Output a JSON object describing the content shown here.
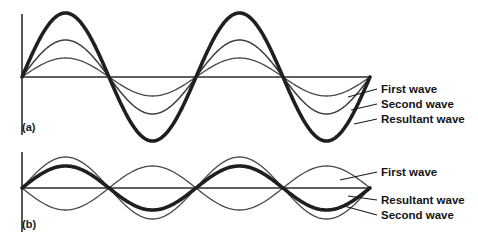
{
  "figure": {
    "background_color": "#ffffff",
    "width": 478,
    "height": 248
  },
  "panels": [
    {
      "tag": "(a)",
      "tag_x": 22,
      "tag_y": 131,
      "baseline_y": 77,
      "axis_x": 22,
      "axis_top": 14,
      "axis_bottom": 135,
      "x_start": 22,
      "x_end": 370,
      "cycles": 2,
      "labels": [
        {
          "text": "First wave",
          "x": 381,
          "y": 93,
          "leader_from_x": 348,
          "leader_from_y": 97,
          "leader_to_x": 377,
          "leader_to_y": 89
        },
        {
          "text": "Second wave",
          "x": 381,
          "y": 108,
          "leader_from_x": 351,
          "leader_from_y": 110,
          "leader_to_x": 377,
          "leader_to_y": 104
        },
        {
          "text": "Resultant wave",
          "x": 381,
          "y": 123,
          "leader_from_x": 354,
          "leader_from_y": 124,
          "leader_to_x": 377,
          "leader_to_y": 119
        }
      ]
    },
    {
      "tag": "(b)",
      "tag_x": 22,
      "tag_y": 228,
      "baseline_y": 188,
      "axis_x": 22,
      "axis_top": 152,
      "axis_bottom": 232,
      "x_start": 22,
      "x_end": 370,
      "cycles": 2,
      "labels": [
        {
          "text": "First wave",
          "x": 381,
          "y": 176,
          "leader_from_x": 340,
          "leader_from_y": 180,
          "leader_to_x": 377,
          "leader_to_y": 172
        },
        {
          "text": "Resultant wave",
          "x": 381,
          "y": 204,
          "leader_from_x": 348,
          "leader_from_y": 196,
          "leader_to_x": 377,
          "leader_to_y": 200
        },
        {
          "text": "Second wave",
          "x": 381,
          "y": 219,
          "leader_from_x": 344,
          "leader_from_y": 206,
          "leader_to_x": 377,
          "leader_to_y": 215
        }
      ]
    }
  ],
  "chart_data": {
    "type": "line",
    "xlabel": "",
    "ylabel": "",
    "grid": false,
    "legend_position": "right",
    "x_domain_cycles": 2,
    "panels": [
      {
        "id": "a",
        "caption": "(a)",
        "description": "Two waves in phase; amplitudes add constructively.",
        "baseline_pixel_y": 77,
        "series": [
          {
            "name": "First wave",
            "amplitude": 19,
            "phase_deg": 0,
            "style": "thin",
            "color": "#4a4a4a"
          },
          {
            "name": "Second wave",
            "amplitude": 37,
            "phase_deg": 0,
            "style": "medium",
            "color": "#3d3d3d"
          },
          {
            "name": "Resultant wave",
            "amplitude": 64,
            "phase_deg": 0,
            "style": "thick",
            "color": "#1f1f1f"
          }
        ]
      },
      {
        "id": "b",
        "caption": "(b)",
        "description": "Two waves 180 degrees out of phase; amplitudes partially cancel.",
        "baseline_pixel_y": 188,
        "series": [
          {
            "name": "First wave",
            "amplitude": 31,
            "phase_deg": 0,
            "style": "thin",
            "color": "#4a4a4a"
          },
          {
            "name": "Second wave",
            "amplitude": 22,
            "phase_deg": 180,
            "style": "thin",
            "color": "#4a4a4a"
          },
          {
            "name": "Resultant wave",
            "amplitude": 22,
            "phase_deg": 0,
            "style": "thick",
            "color": "#1f1f1f"
          }
        ]
      }
    ]
  }
}
